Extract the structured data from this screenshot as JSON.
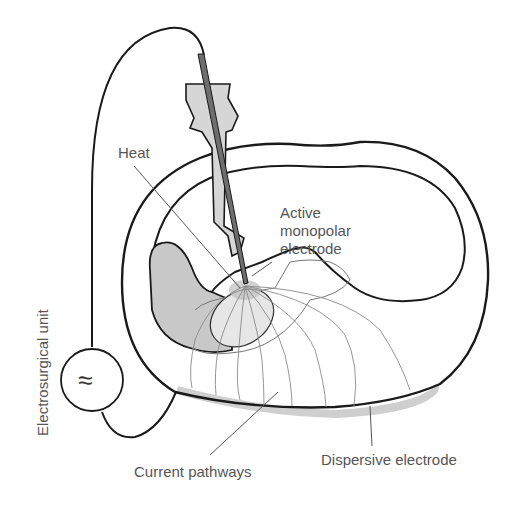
{
  "labels": {
    "heat": "Heat",
    "active_electrode": [
      "Active",
      "monopolar",
      "electrode"
    ],
    "electrosurgical_unit": "Electrosurgical unit",
    "current_pathways": "Current pathways",
    "dispersive_electrode": "Dispersive electrode"
  },
  "icons": {
    "generator_symbol": "≈"
  },
  "colors": {
    "outline": "#1a1a1a",
    "label_text": "#555555",
    "tissue_shade": "#c8c8c8",
    "electrode_rod": "#6e6e6e",
    "handle_fill": "#d6d6d6",
    "dispersive_pad": "#cfcfcf",
    "current_lines": "#8a8a8a"
  }
}
